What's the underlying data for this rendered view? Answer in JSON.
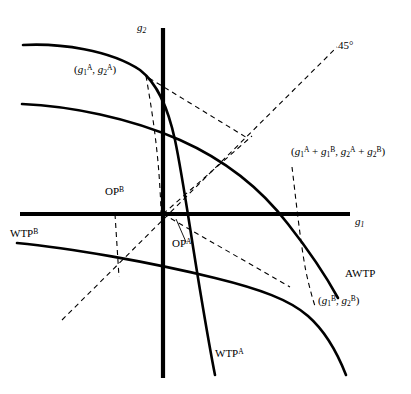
{
  "figure": {
    "type": "economics-indifference-curve-diagram",
    "background_color": "#ffffff",
    "line_color": "#000000",
    "axes": {
      "x_axis_label": "g1",
      "y_axis_label": "g2",
      "origin_px": [
        163,
        214
      ]
    }
  },
  "labels": {
    "y_axis": {
      "base": "g",
      "sub": "2"
    },
    "x_axis": {
      "base": "g",
      "sub": "1"
    },
    "diagonal_45": "45°",
    "point_A": {
      "open": "(",
      "g1_base": "g",
      "g1_sub": "1",
      "g1_sup": "A",
      "comma": ", ",
      "g2_base": "g",
      "g2_sub": "2",
      "g2_sup": "A",
      "close": ")"
    },
    "point_B": {
      "open": "(",
      "g1_base": "g",
      "g1_sub": "1",
      "g1_sup": "B",
      "comma": ", ",
      "g2_base": "g",
      "g2_sub": "2",
      "g2_sup": "B",
      "close": ")"
    },
    "point_sum": {
      "open": "(",
      "t1_base": "g",
      "t1_sub": "1",
      "t1_sup": "A",
      "plus1": " + ",
      "t2_base": "g",
      "t2_sub": "1",
      "t2_sup": "B",
      "comma": ", ",
      "t3_base": "g",
      "t3_sub": "2",
      "t3_sup": "A",
      "plus2": " + ",
      "t4_base": "g",
      "t4_sub": "2",
      "t4_sup": "B",
      "close": ")"
    },
    "op_a": {
      "base": "OP",
      "sup": "A"
    },
    "op_b": {
      "base": "OP",
      "sup": "B"
    },
    "wtp_a": {
      "base": "WTP",
      "sup": "A"
    },
    "wtp_b": {
      "base": "WTP",
      "sup": "B"
    },
    "awtp": "AWTP"
  },
  "curves": [
    {
      "name": "WTP-A",
      "style": "solid",
      "width": 2.6
    },
    {
      "name": "AWTP",
      "style": "solid",
      "width": 2.6
    },
    {
      "name": "WTP-B",
      "style": "solid",
      "width": 2.6
    }
  ],
  "dashed_lines": [
    {
      "name": "45-degree-line"
    },
    {
      "name": "dropper-from-point-A"
    },
    {
      "name": "dropper-from-sum-point"
    },
    {
      "name": "ray-to-point-A"
    },
    {
      "name": "ray-to-sum-point"
    },
    {
      "name": "ray-to-point-B"
    },
    {
      "name": "op-b-vertical"
    },
    {
      "name": "op-b-horizontal"
    }
  ]
}
